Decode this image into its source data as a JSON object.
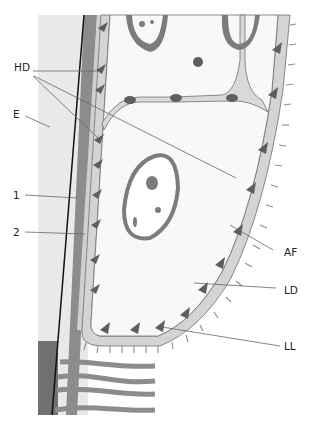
{
  "figure": {
    "type": "schematic",
    "colors": {
      "background": "#ffffff",
      "epidermis_strip": "#e9e9e9",
      "dark_band": "#8a8a8a",
      "basement_light": "#d4d4d4",
      "cell_fill": "#f8f8f8",
      "outline": "#6f6f6f",
      "nucleus": "#7c7c7c",
      "hemidesmosome": "#5e5e5e",
      "fibril": "#8e8e8e",
      "black_line": "#111111",
      "leader": "#666666",
      "collagen": "#8c8c8c"
    }
  },
  "labels": {
    "hd": "HD",
    "e": "E",
    "one": "1",
    "two": "2",
    "af": "AF",
    "ld": "LD",
    "ll": "LL"
  }
}
